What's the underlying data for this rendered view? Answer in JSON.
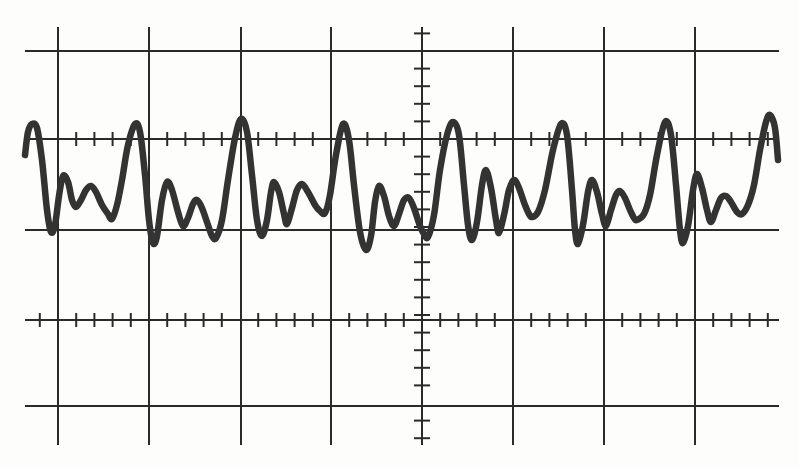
{
  "figure": {
    "title": "Oscilloscope graticule with periodic complex waveform",
    "colors": {
      "background": "#fdfdfc",
      "grid": "#2a2a2a",
      "trace": "#333333"
    }
  },
  "graticule": {
    "horizontal_lines_y": [
      51,
      139,
      230,
      320,
      406
    ],
    "vertical_lines_x": [
      58,
      149,
      241,
      331,
      513,
      604,
      695
    ],
    "h_extent": [
      25,
      779
    ],
    "v_extent": [
      27,
      445
    ],
    "center_axis_x": 422,
    "center_axis_extent": [
      27,
      445
    ],
    "tick_rows_y": [
      139,
      320
    ],
    "tick_spacing": 18.2,
    "tick_half_length": 7
  },
  "chart_data": {
    "type": "line",
    "title": "",
    "xlabel": "",
    "ylabel": "",
    "grid": true,
    "divisions": {
      "horizontal": 8,
      "vertical": 4
    },
    "points": [
      [
        25,
        155
      ],
      [
        28,
        132
      ],
      [
        32,
        124
      ],
      [
        37,
        128
      ],
      [
        42,
        160
      ],
      [
        47,
        210
      ],
      [
        51,
        232
      ],
      [
        55,
        225
      ],
      [
        59,
        196
      ],
      [
        63,
        176
      ],
      [
        68,
        182
      ],
      [
        72,
        200
      ],
      [
        76,
        207
      ],
      [
        81,
        200
      ],
      [
        86,
        190
      ],
      [
        91,
        186
      ],
      [
        96,
        192
      ],
      [
        102,
        205
      ],
      [
        108,
        214
      ],
      [
        112,
        219
      ],
      [
        117,
        205
      ],
      [
        122,
        180
      ],
      [
        128,
        145
      ],
      [
        135,
        124
      ],
      [
        140,
        132
      ],
      [
        145,
        175
      ],
      [
        149,
        220
      ],
      [
        153,
        243
      ],
      [
        157,
        236
      ],
      [
        162,
        200
      ],
      [
        167,
        182
      ],
      [
        172,
        190
      ],
      [
        178,
        212
      ],
      [
        183,
        226
      ],
      [
        188,
        218
      ],
      [
        193,
        204
      ],
      [
        197,
        200
      ],
      [
        202,
        208
      ],
      [
        208,
        225
      ],
      [
        212,
        236
      ],
      [
        216,
        238
      ],
      [
        222,
        220
      ],
      [
        228,
        180
      ],
      [
        235,
        138
      ],
      [
        241,
        119
      ],
      [
        247,
        132
      ],
      [
        252,
        175
      ],
      [
        257,
        220
      ],
      [
        262,
        236
      ],
      [
        267,
        220
      ],
      [
        271,
        192
      ],
      [
        274,
        182
      ],
      [
        279,
        192
      ],
      [
        284,
        214
      ],
      [
        287,
        224
      ],
      [
        292,
        208
      ],
      [
        297,
        190
      ],
      [
        302,
        184
      ],
      [
        308,
        192
      ],
      [
        315,
        205
      ],
      [
        320,
        211
      ],
      [
        325,
        213
      ],
      [
        330,
        195
      ],
      [
        336,
        155
      ],
      [
        343,
        124
      ],
      [
        349,
        140
      ],
      [
        354,
        185
      ],
      [
        360,
        232
      ],
      [
        366,
        250
      ],
      [
        371,
        236
      ],
      [
        375,
        202
      ],
      [
        379,
        186
      ],
      [
        384,
        196
      ],
      [
        389,
        216
      ],
      [
        394,
        226
      ],
      [
        399,
        214
      ],
      [
        404,
        200
      ],
      [
        409,
        198
      ],
      [
        414,
        208
      ],
      [
        420,
        226
      ],
      [
        424,
        234
      ],
      [
        428,
        237
      ],
      [
        434,
        215
      ],
      [
        440,
        170
      ],
      [
        447,
        135
      ],
      [
        453,
        122
      ],
      [
        459,
        135
      ],
      [
        464,
        185
      ],
      [
        468,
        225
      ],
      [
        472,
        240
      ],
      [
        477,
        222
      ],
      [
        482,
        185
      ],
      [
        486,
        170
      ],
      [
        491,
        188
      ],
      [
        496,
        220
      ],
      [
        499,
        233
      ],
      [
        504,
        215
      ],
      [
        509,
        190
      ],
      [
        514,
        180
      ],
      [
        519,
        188
      ],
      [
        525,
        205
      ],
      [
        529,
        214
      ],
      [
        532,
        217
      ],
      [
        538,
        212
      ],
      [
        545,
        190
      ],
      [
        553,
        150
      ],
      [
        561,
        124
      ],
      [
        567,
        135
      ],
      [
        572,
        190
      ],
      [
        575,
        230
      ],
      [
        578,
        244
      ],
      [
        583,
        225
      ],
      [
        588,
        192
      ],
      [
        592,
        180
      ],
      [
        597,
        192
      ],
      [
        602,
        214
      ],
      [
        606,
        226
      ],
      [
        611,
        210
      ],
      [
        616,
        195
      ],
      [
        620,
        191
      ],
      [
        625,
        198
      ],
      [
        630,
        210
      ],
      [
        634,
        218
      ],
      [
        637,
        220
      ],
      [
        644,
        214
      ],
      [
        650,
        195
      ],
      [
        657,
        155
      ],
      [
        665,
        122
      ],
      [
        671,
        135
      ],
      [
        676,
        185
      ],
      [
        680,
        230
      ],
      [
        683,
        243
      ],
      [
        688,
        226
      ],
      [
        693,
        190
      ],
      [
        697,
        174
      ],
      [
        702,
        188
      ],
      [
        707,
        210
      ],
      [
        711,
        222
      ],
      [
        716,
        210
      ],
      [
        721,
        198
      ],
      [
        726,
        196
      ],
      [
        731,
        202
      ],
      [
        737,
        212
      ],
      [
        742,
        214
      ],
      [
        748,
        205
      ],
      [
        754,
        185
      ],
      [
        760,
        150
      ],
      [
        766,
        122
      ],
      [
        770,
        115
      ],
      [
        775,
        128
      ],
      [
        778,
        160
      ]
    ],
    "peaks_x": [
      32,
      135,
      241,
      343,
      453,
      561,
      665,
      770
    ]
  }
}
